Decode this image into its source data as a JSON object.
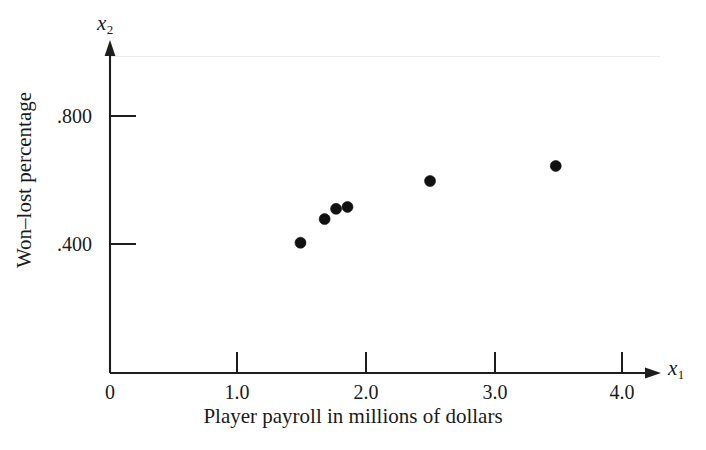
{
  "chart_data": {
    "type": "scatter",
    "title": "",
    "xlabel": "Player payroll in millions of dollars",
    "ylabel": "Won–lost percentage",
    "x_axis_variable": "x",
    "x_axis_subscript": "1",
    "y_axis_variable": "x",
    "y_axis_subscript": "2",
    "xlim": [
      0,
      4.33
    ],
    "ylim": [
      0,
      0.945
    ],
    "grid": false,
    "legend": null,
    "xticks": [
      0,
      1.0,
      2.0,
      3.0,
      4.0
    ],
    "xtick_labels": [
      "0",
      "1.0",
      "2.0",
      "3.0",
      "4.0"
    ],
    "yticks": [
      0.4,
      0.8
    ],
    "ytick_labels": [
      ".400",
      ".800"
    ],
    "marker": "filled-circle",
    "marker_color": "#111111",
    "marker_size_px": 11,
    "points": [
      {
        "x": 1.5,
        "y": 0.407
      },
      {
        "x": 1.69,
        "y": 0.481
      },
      {
        "x": 1.78,
        "y": 0.513
      },
      {
        "x": 1.87,
        "y": 0.519
      },
      {
        "x": 2.52,
        "y": 0.6
      },
      {
        "x": 3.51,
        "y": 0.647
      }
    ],
    "x_values": [
      1.5,
      1.69,
      1.78,
      1.87,
      2.52,
      3.51
    ],
    "y_values": [
      0.407,
      0.481,
      0.513,
      0.519,
      0.6,
      0.647
    ],
    "axis_color": "#1d1d1d",
    "background_color": "#ffffff"
  }
}
